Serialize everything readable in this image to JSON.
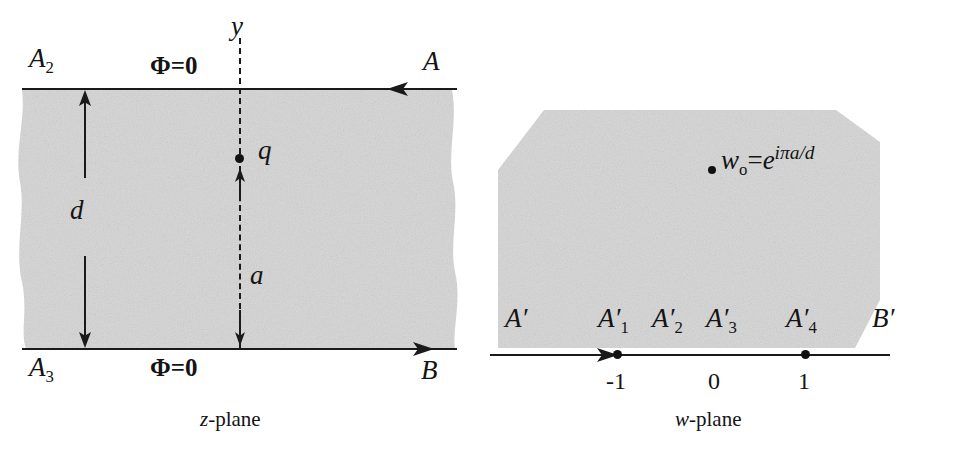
{
  "figure": {
    "background_color": "#ffffff",
    "ink_color": "#1a1a1a",
    "shade_color": "#d5d5d5"
  },
  "z_panel": {
    "caption_italic": "z",
    "caption_rest": "-plane",
    "top_boundary": {
      "left_label": "A",
      "left_label_sub": "2",
      "potential_label": "Φ=0",
      "right_label": "A",
      "arrow_direction": "left"
    },
    "bottom_boundary": {
      "left_label": "A",
      "left_label_sub": "3",
      "potential_label": "Φ=0",
      "right_label": "B",
      "arrow_direction": "right"
    },
    "axis_label": "y",
    "charge_label": "q",
    "width_label": "d",
    "height_label": "a"
  },
  "w_panel": {
    "caption_italic": "w",
    "caption_rest": "-plane",
    "point_label_base": "w",
    "point_label_sub": "o",
    "point_label_eq": "=",
    "point_label_exp_base": "e",
    "point_label_exponent": "iπa/d",
    "point_label_full": "wₒ = e^{iπa/d}",
    "boundary_labels": [
      {
        "base": "A",
        "prime": "′",
        "sub": ""
      },
      {
        "base": "A",
        "prime": "′",
        "sub": "1"
      },
      {
        "base": "A",
        "prime": "′",
        "sub": "2"
      },
      {
        "base": "A",
        "prime": "′",
        "sub": "3"
      },
      {
        "base": "A",
        "prime": "′",
        "sub": "4"
      },
      {
        "base": "B",
        "prime": "′",
        "sub": ""
      }
    ],
    "tick_labels": [
      "-1",
      "0",
      "1"
    ],
    "arrow_direction": "right"
  }
}
